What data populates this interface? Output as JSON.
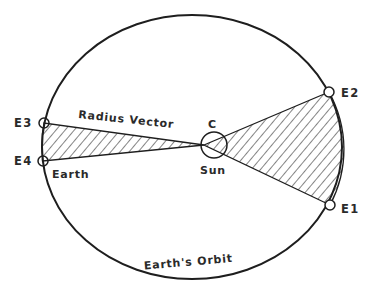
{
  "diagram": {
    "labels": {
      "e1": "E1",
      "e2": "E2",
      "e3": "E3",
      "e4": "E4",
      "earth": "Earth",
      "sun": "Sun",
      "center": "C",
      "radius_vector": "Radius Vector",
      "orbit": "Earth's Orbit"
    },
    "colors": {
      "line": "#1e1e1e",
      "text": "#2a2a2a",
      "background": "#ffffff"
    },
    "orbit": {
      "cx": 192,
      "cy": 147,
      "rx": 150,
      "ry": 132
    },
    "sun": {
      "cx": 214,
      "cy": 145,
      "r": 13
    },
    "points": {
      "e1": {
        "x": 330,
        "y": 205
      },
      "e2": {
        "x": 329,
        "y": 92
      },
      "e3": {
        "x": 44,
        "y": 123
      },
      "e4": {
        "x": 43,
        "y": 161
      }
    },
    "focus": {
      "x": 204,
      "y": 145
    }
  }
}
